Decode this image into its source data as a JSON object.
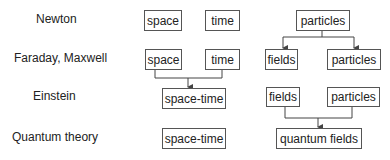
{
  "rows": [
    {
      "label": "Newton"
    },
    {
      "label": "Faraday, Maxwell"
    },
    {
      "label": "Einstein"
    },
    {
      "label": "Quantum theory"
    }
  ],
  "boxes": {
    "r1_space": "space",
    "r1_time": "time",
    "r1_particles": "particles",
    "r2_space": "space",
    "r2_time": "time",
    "r2_fields": "fields",
    "r2_particles": "particles",
    "r3_spacetime": "space-time",
    "r3_fields": "fields",
    "r3_particles": "particles",
    "r4_spacetime": "space-time",
    "r4_quantum_fields": "quantum fields"
  },
  "colors": {
    "line": "#444444",
    "border": "#555555",
    "text": "#222222"
  }
}
